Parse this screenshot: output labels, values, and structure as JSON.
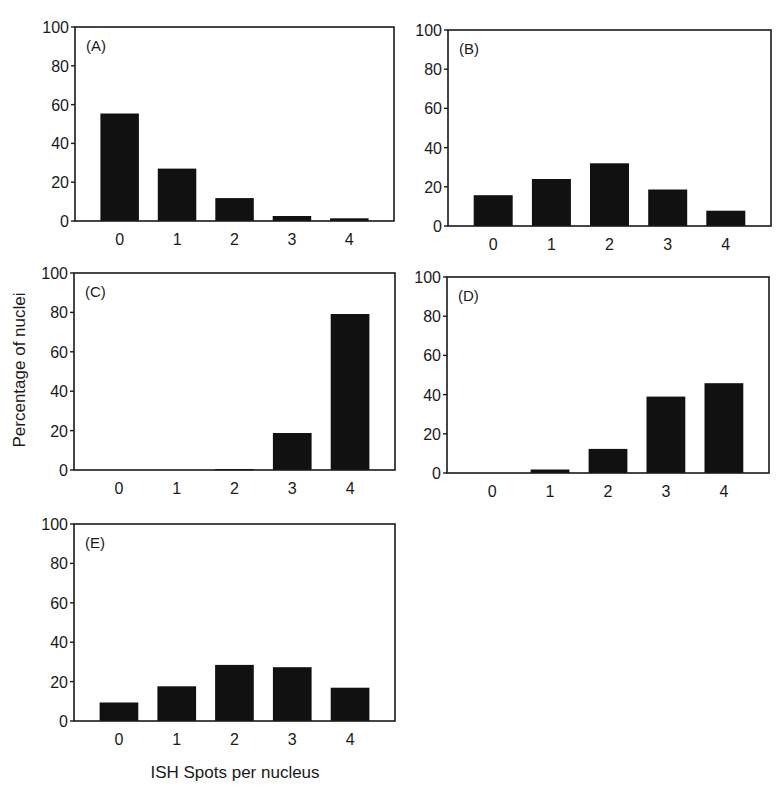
{
  "figure": {
    "ylabel": "Percentage of nuclei",
    "xlabel": "ISH Spots per nucleus",
    "colors": {
      "bar": "#111111",
      "axis": "#1a1a1a",
      "text": "#1a1a1a",
      "background": "#ffffff"
    }
  },
  "chart_data": [
    {
      "type": "bar",
      "panel": "(A)",
      "categories": [
        "0",
        "1",
        "2",
        "3",
        "4"
      ],
      "values": [
        55.4,
        27.0,
        11.8,
        2.6,
        1.4
      ],
      "xlabel": "ISH Spots per nucleus",
      "ylabel": "Percentage of nuclei",
      "ylim": [
        0,
        100
      ],
      "yticks": [
        0,
        20,
        40,
        60,
        80,
        100
      ],
      "grid": false,
      "legend": null,
      "frame": {
        "x0": 75,
        "y0": 27,
        "x1": 394,
        "y1": 221
      }
    },
    {
      "type": "bar",
      "panel": "(B)",
      "categories": [
        "0",
        "1",
        "2",
        "3",
        "4"
      ],
      "values": [
        15.7,
        24.0,
        32.0,
        18.6,
        7.8
      ],
      "xlabel": "ISH Spots per nucleus",
      "ylabel": "Percentage of nuclei",
      "ylim": [
        0,
        100
      ],
      "yticks": [
        0,
        20,
        40,
        60,
        80,
        100
      ],
      "grid": false,
      "legend": null,
      "frame": {
        "x0": 448,
        "y0": 30,
        "x1": 771,
        "y1": 226
      }
    },
    {
      "type": "bar",
      "panel": "(C)",
      "categories": [
        "0",
        "1",
        "2",
        "3",
        "4"
      ],
      "values": [
        0,
        0,
        0.5,
        18.8,
        79.2
      ],
      "xlabel": "ISH Spots per nucleus",
      "ylabel": "Percentage of nuclei",
      "ylim": [
        0,
        100
      ],
      "yticks": [
        0,
        20,
        40,
        60,
        80,
        100
      ],
      "grid": false,
      "legend": null,
      "frame": {
        "x0": 74,
        "y0": 273,
        "x1": 395,
        "y1": 470
      }
    },
    {
      "type": "bar",
      "panel": "(D)",
      "categories": [
        "0",
        "1",
        "2",
        "3",
        "4"
      ],
      "values": [
        0,
        1.8,
        12.3,
        39.0,
        45.8
      ],
      "xlabel": "ISH Spots per nucleus",
      "ylabel": "Percentage of nuclei",
      "ylim": [
        0,
        100
      ],
      "yticks": [
        0,
        20,
        40,
        60,
        80,
        100
      ],
      "grid": false,
      "legend": null,
      "frame": {
        "x0": 447,
        "y0": 277,
        "x1": 769,
        "y1": 473
      }
    },
    {
      "type": "bar",
      "panel": "(E)",
      "categories": [
        "0",
        "1",
        "2",
        "3",
        "4"
      ],
      "values": [
        9.4,
        17.6,
        28.5,
        27.3,
        16.9
      ],
      "xlabel": "ISH Spots per nucleus",
      "ylabel": "Percentage of nuclei",
      "ylim": [
        0,
        100
      ],
      "yticks": [
        0,
        20,
        40,
        60,
        80,
        100
      ],
      "grid": false,
      "legend": null,
      "frame": {
        "x0": 74,
        "y0": 524,
        "x1": 395,
        "y1": 721
      }
    }
  ]
}
